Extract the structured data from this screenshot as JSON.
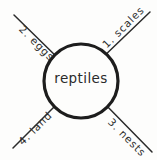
{
  "diagram": {
    "type": "cluster-web",
    "center": {
      "label": "reptiles"
    },
    "branches": [
      {
        "id": "scales",
        "label": "1. scales",
        "position": "top-right",
        "number": "1",
        "term": "scales"
      },
      {
        "id": "eggs",
        "label": "2. eggs",
        "position": "top-left",
        "number": "2",
        "term": "eggs"
      },
      {
        "id": "nests",
        "label": "3. nests",
        "position": "bottom-right",
        "number": "3",
        "term": "nests"
      },
      {
        "id": "land",
        "label": "4. land",
        "position": "bottom-left",
        "number": "4",
        "term": "land"
      }
    ],
    "colors": {
      "ink": "#2b2b2b",
      "background": "#fdfdfc"
    }
  }
}
